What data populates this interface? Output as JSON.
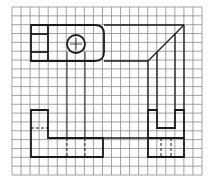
{
  "diagram": {
    "type": "orthographic-projection-grid",
    "grid": {
      "x0": 12,
      "y0": 7,
      "x1": 202,
      "y1": 175,
      "cols": 21,
      "rows": 19,
      "color": "#8a8a8a"
    },
    "line_color": "#1a1a1a",
    "views": [
      {
        "name": "top-view",
        "shape": "rounded-rectangle-with-circle"
      },
      {
        "name": "front-view",
        "shape": "L-shape-with-hidden-lines"
      },
      {
        "name": "side-view",
        "shape": "U-shape-with-hidden-lines"
      }
    ],
    "projection_lines": "miter-line-construction"
  }
}
